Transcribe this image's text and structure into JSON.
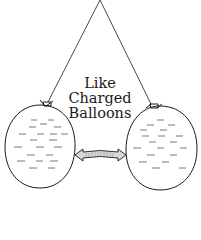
{
  "diagram": {
    "label_lines": [
      "Like",
      "Charged",
      "Balloons"
    ],
    "colors": {
      "stroke": "#1a1a1a",
      "background": "#ffffff",
      "arrow_fill": "#d8d8d8"
    },
    "elements": {
      "strings": {
        "apex": [
          100,
          0
        ],
        "left_end": [
          48,
          101
        ],
        "right_end": [
          151,
          104
        ]
      },
      "balloons": [
        {
          "name": "left-balloon",
          "cx": 40,
          "cy": 147,
          "rx": 35,
          "ry": 42,
          "charge_marks": "negative-dashes"
        },
        {
          "name": "right-balloon",
          "cx": 162,
          "cy": 148,
          "rx": 36,
          "ry": 42,
          "charge_marks": "negative-dashes"
        }
      ],
      "repulsion_arrow": {
        "from": [
          75,
          155
        ],
        "to": [
          126,
          155
        ],
        "direction": "double-headed"
      }
    }
  }
}
